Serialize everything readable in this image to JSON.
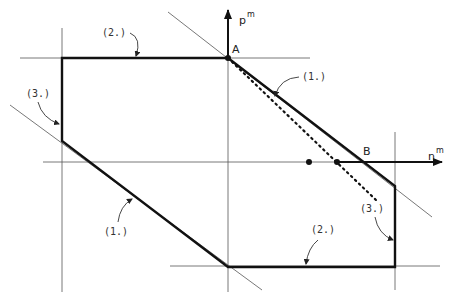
{
  "axes": {
    "vertical": {
      "label": "p",
      "superscript": "m"
    },
    "horizontal": {
      "label": "n",
      "superscript": "m"
    }
  },
  "points": {
    "A": {
      "label": "A"
    },
    "B": {
      "label": "B"
    }
  },
  "annotations": [
    {
      "id": "top-edge",
      "label": "(2.)"
    },
    {
      "id": "left-edge",
      "label": "(3.)"
    },
    {
      "id": "upper-diagonal",
      "label": "(1.)"
    },
    {
      "id": "lower-diagonal",
      "label": "(1.)"
    },
    {
      "id": "bottom-edge",
      "label": "(2.)"
    },
    {
      "id": "right-edge",
      "label": "(3.)"
    }
  ],
  "colors": {
    "stroke_heavy": "#111111",
    "stroke_thin": "#555555",
    "background": "#ffffff"
  }
}
